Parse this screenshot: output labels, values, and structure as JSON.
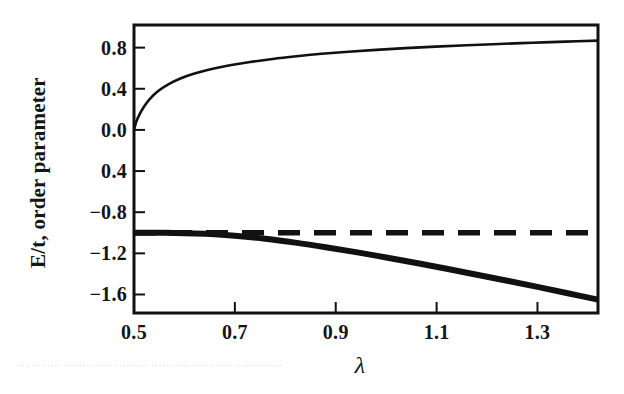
{
  "chart_data": {
    "type": "line",
    "title": "",
    "xlabel": "λ",
    "ylabel": "E/t, order parameter",
    "xlim": [
      0.5,
      1.42
    ],
    "ylim": [
      -1.78,
      1.02
    ],
    "xticks": [
      0.5,
      0.7,
      0.9,
      1.1,
      1.3
    ],
    "xtick_labels": [
      "0.5",
      "0.7",
      "0.9",
      "1.1",
      "1.3"
    ],
    "yticks": [
      0.8,
      0.4,
      0.0,
      -0.4,
      -0.8,
      -1.2,
      -1.6
    ],
    "ytick_labels": [
      "0.8",
      "0.4",
      "0.0",
      "0.4",
      "−0.8",
      "−1.2",
      "−1.6"
    ],
    "grid": false,
    "legend": "none",
    "frame": "box",
    "series": [
      {
        "name": "order parameter",
        "style": "solid-thin",
        "color": "#111111",
        "x": [
          0.5,
          0.505,
          0.512,
          0.52,
          0.532,
          0.548,
          0.568,
          0.592,
          0.62,
          0.654,
          0.69,
          0.73,
          0.775,
          0.822,
          0.872,
          0.925,
          0.98,
          1.038,
          1.098,
          1.16,
          1.224,
          1.29,
          1.356,
          1.42
        ],
        "y": [
          0.0,
          0.085,
          0.16,
          0.228,
          0.305,
          0.378,
          0.443,
          0.5,
          0.548,
          0.592,
          0.628,
          0.66,
          0.69,
          0.716,
          0.74,
          0.76,
          0.778,
          0.795,
          0.81,
          0.823,
          0.836,
          0.848,
          0.858,
          0.868
        ]
      },
      {
        "name": "ground state energy E/t",
        "style": "solid-thick",
        "color": "#111111",
        "x": [
          0.5,
          0.56,
          0.62,
          0.66,
          0.7,
          0.76,
          0.82,
          0.88,
          0.94,
          1.0,
          1.06,
          1.12,
          1.18,
          1.24,
          1.3,
          1.36,
          1.42
        ],
        "y": [
          -1.0,
          -1.001,
          -1.006,
          -1.014,
          -1.028,
          -1.058,
          -1.096,
          -1.14,
          -1.188,
          -1.24,
          -1.294,
          -1.35,
          -1.408,
          -1.466,
          -1.526,
          -1.588,
          -1.65
        ]
      },
      {
        "name": "reference energy (dashed)",
        "style": "dashed",
        "color": "#111111",
        "x": [
          0.5,
          1.415
        ],
        "y": [
          -1.0,
          -1.0
        ]
      }
    ]
  },
  "artifact_text": "··· ·· ····· ········ ···· ········· ····· ··········· ···· ·············"
}
